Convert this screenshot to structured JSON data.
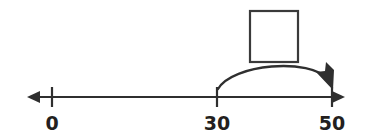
{
  "figure": {
    "kind": "number-line-diagram",
    "colors": {
      "ink": "#2f2f2f",
      "label_ink": "#231f20",
      "background": "#ffffff",
      "box_stroke": "#3a3a3a",
      "box_fill": "#ffffff"
    },
    "stroke_width": 2.2
  },
  "number_line": {
    "name": "number-line",
    "axis_y": 97,
    "start_x": 27,
    "end_x": 345,
    "left_arrowhead": true,
    "right_arrowhead": true,
    "tick_top_y": 87,
    "tick_bottom_y": 107,
    "ticks": [
      {
        "label": "0",
        "x": 52
      },
      {
        "label": "30",
        "x": 217
      },
      {
        "label": "50",
        "x": 332
      }
    ],
    "label_baseline_y": 130
  },
  "jump_arc": {
    "name": "jump-arc-30-to-50",
    "from_label": "30",
    "to_label": "50",
    "from_x": 218,
    "to_x": 332,
    "base_y": 89,
    "apex_y": 62,
    "arrowhead": "at-end-pointing-down-right",
    "path": "M 218 89 C 238 62, 312 59, 331 84",
    "arrowhead_points": "331,89 316,71 324,70 329,73 330,64 336,68"
  },
  "answer_box": {
    "name": "answer-box",
    "x": 250,
    "y": 11,
    "width": 48,
    "height": 51,
    "value": "",
    "placeholder": ""
  }
}
